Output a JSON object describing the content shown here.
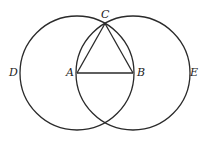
{
  "diagram": {
    "type": "geometric-construction",
    "points": {
      "A": {
        "label": "A",
        "x": 77,
        "y": 73
      },
      "B": {
        "label": "B",
        "x": 133,
        "y": 73
      },
      "C": {
        "label": "C",
        "x": 105,
        "y": 24
      },
      "D": {
        "label": "D",
        "x": 20,
        "y": 73
      },
      "E": {
        "label": "E",
        "x": 190,
        "y": 73
      }
    },
    "circles": [
      {
        "name": "circle-centered-A",
        "cx": 77,
        "cy": 73,
        "r": 57
      },
      {
        "name": "circle-centered-B",
        "cx": 133,
        "cy": 73,
        "r": 57
      }
    ],
    "segments": [
      [
        "A",
        "B"
      ],
      [
        "A",
        "C"
      ],
      [
        "B",
        "C"
      ]
    ],
    "stroke_color": "#2a2a2a"
  }
}
